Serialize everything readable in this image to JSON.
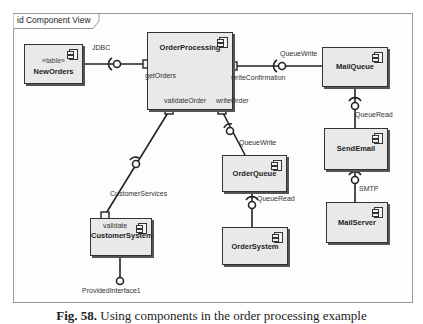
{
  "diagram": {
    "frame_label": "id Component View",
    "components": [
      {
        "id": "new-orders",
        "name": "NewOrders",
        "stereotype": "«table»"
      },
      {
        "id": "order-processing",
        "name": "OrderProcessing"
      },
      {
        "id": "mail-queue",
        "name": "MailQueue"
      },
      {
        "id": "send-email",
        "name": "SendEmail"
      },
      {
        "id": "mail-server",
        "name": "MailServer"
      },
      {
        "id": "order-queue",
        "name": "OrderQueue"
      },
      {
        "id": "order-system",
        "name": "OrderSystem"
      },
      {
        "id": "customer-system",
        "name": "CustomerSystem",
        "port_label": "validate"
      }
    ],
    "labels": {
      "jdbc": "JDBC",
      "get_orders": "getOrders",
      "write_confirmation": "writeConfirmation",
      "queue_write_mail": "QueueWrite",
      "validate_order": "validateOrder",
      "write_order": "writeOrder",
      "queue_write_order": "QueueWrite",
      "queue_read_mail": "QueueRead",
      "queue_read_order": "QueueRead",
      "smtp": "SMTP",
      "customer_services": "CustomerServices",
      "provided_interface": "ProvidedInterface1"
    },
    "colors": {
      "component_fill": "#e9e9e9",
      "border": "#333333",
      "frame_border": "#9a9a9a"
    }
  },
  "caption": {
    "number": "Fig. 58.",
    "text": "Using components in the order processing example"
  }
}
